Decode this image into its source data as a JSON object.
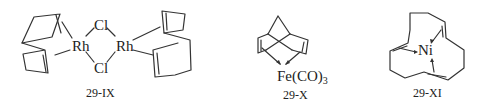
{
  "figure": {
    "structures": [
      {
        "id": "29-IX",
        "label": "29-IX",
        "atoms": {
          "metal1": "Rh",
          "metal2": "Rh",
          "bridge1": "Cl",
          "bridge2": "Cl"
        },
        "description": "Chloro-bridged dimer of Rh with two 1,5-cyclooctadiene ligands"
      },
      {
        "id": "29-X",
        "label": "29-X",
        "atoms": {
          "metal": "Fe(CO)",
          "subscript": "3"
        },
        "description": "Norbornadiene iron tricarbonyl"
      },
      {
        "id": "29-XI",
        "label": "29-XI",
        "atoms": {
          "metal": "Ni"
        },
        "description": "Cyclododecatriene nickel complex"
      }
    ]
  }
}
